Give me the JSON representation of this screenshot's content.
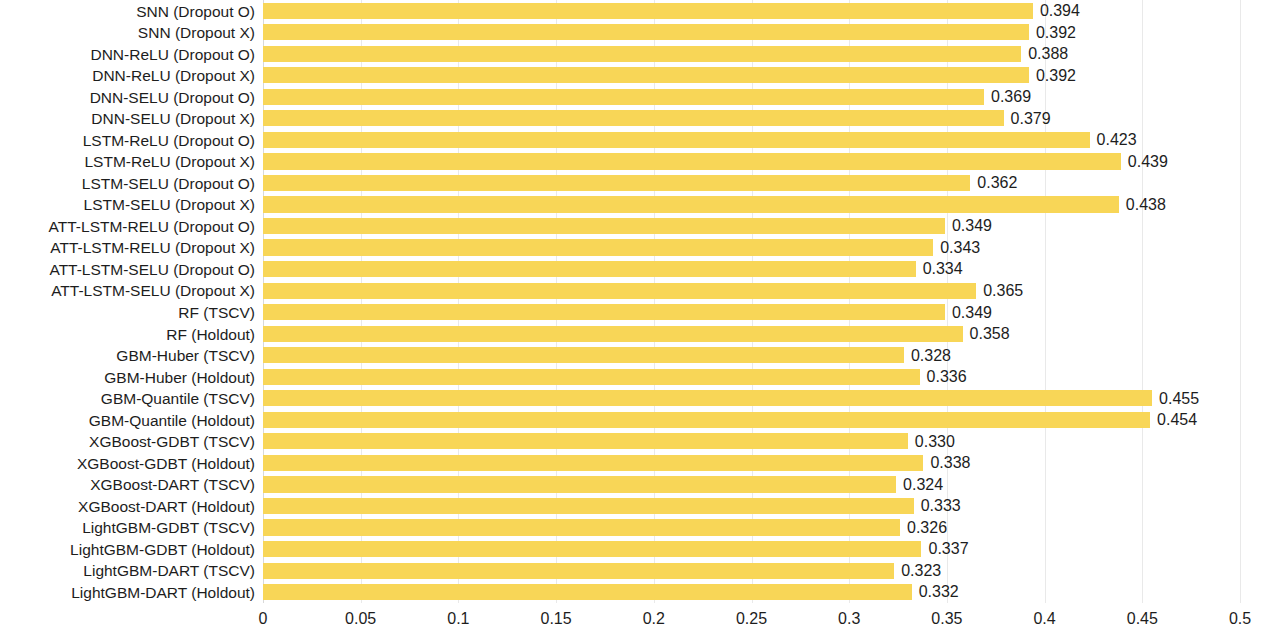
{
  "chart_data": {
    "type": "bar",
    "orientation": "horizontal",
    "title": "",
    "subtitle": "",
    "xlabel": "",
    "ylabel": "",
    "xlim": [
      0,
      0.5
    ],
    "xticks": [
      "0",
      "0.05",
      "0.1",
      "0.15",
      "0.2",
      "0.25",
      "0.3",
      "0.35",
      "0.4",
      "0.45",
      "0.5"
    ],
    "xtick_values": [
      0,
      0.05,
      0.1,
      0.15,
      0.2,
      0.25,
      0.3,
      0.35,
      0.4,
      0.45,
      0.5
    ],
    "grid": true,
    "grid_axis": "x",
    "legend": false,
    "bar_color": "#f8d657",
    "label_color": "#1d1d1d",
    "background": "#ffffff",
    "categories": [
      "SNN (Dropout O)",
      "SNN (Dropout X)",
      "DNN-ReLU (Dropout O)",
      "DNN-ReLU (Dropout X)",
      "DNN-SELU (Dropout O)",
      "DNN-SELU (Dropout X)",
      "LSTM-ReLU (Dropout O)",
      "LSTM-ReLU (Dropout X)",
      "LSTM-SELU (Dropout O)",
      "LSTM-SELU (Dropout X)",
      "ATT-LSTM-RELU (Dropout O)",
      "ATT-LSTM-RELU (Dropout X)",
      "ATT-LSTM-SELU (Dropout O)",
      "ATT-LSTM-SELU (Dropout X)",
      "RF (TSCV)",
      "RF (Holdout)",
      "GBM-Huber (TSCV)",
      "GBM-Huber (Holdout)",
      "GBM-Quantile (TSCV)",
      "GBM-Quantile (Holdout)",
      "XGBoost-GDBT (TSCV)",
      "XGBoost-GDBT (Holdout)",
      "XGBoost-DART (TSCV)",
      "XGBoost-DART (Holdout)",
      "LightGBM-GDBT (TSCV)",
      "LightGBM-GDBT (Holdout)",
      "LightGBM-DART (TSCV)",
      "LightGBM-DART (Holdout)"
    ],
    "values": [
      0.394,
      0.392,
      0.388,
      0.392,
      0.369,
      0.379,
      0.423,
      0.439,
      0.362,
      0.438,
      0.349,
      0.343,
      0.334,
      0.365,
      0.349,
      0.358,
      0.328,
      0.336,
      0.455,
      0.454,
      0.33,
      0.338,
      0.324,
      0.333,
      0.326,
      0.337,
      0.323,
      0.332
    ],
    "value_labels": [
      "0.394",
      "0.392",
      "0.388",
      "0.392",
      "0.369",
      "0.379",
      "0.423",
      "0.439",
      "0.362",
      "0.438",
      "0.349",
      "0.343",
      "0.334",
      "0.365",
      "0.349",
      "0.358",
      "0.328",
      "0.336",
      "0.455",
      "0.454",
      "0.330",
      "0.338",
      "0.324",
      "0.333",
      "0.326",
      "0.337",
      "0.323",
      "0.332"
    ]
  }
}
